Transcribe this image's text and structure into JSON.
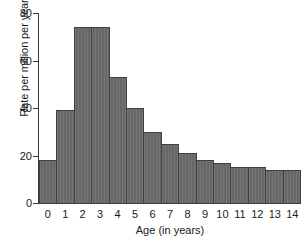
{
  "chart_data": {
    "type": "bar",
    "title": "",
    "xlabel": "Age (in years)",
    "ylabel": "Rate per million per year",
    "categories": [
      "0",
      "1",
      "2",
      "3",
      "4",
      "5",
      "6",
      "7",
      "8",
      "9",
      "10",
      "11",
      "12",
      "13",
      "14"
    ],
    "values": [
      18,
      39,
      74,
      74,
      53,
      40,
      30,
      25,
      21,
      18,
      17,
      15,
      15,
      14,
      14
    ],
    "ylim": [
      0,
      80
    ],
    "y_ticks": [
      0,
      20,
      40,
      60,
      80
    ],
    "y_tick_labels": [
      "0",
      "20",
      "40",
      "60",
      "80"
    ],
    "grid": false,
    "legend": null,
    "bar_color": "#6d6d6d",
    "bar_edge_color": "#3f3f3f",
    "axis_color": "#3a3a3a",
    "text_color": "#1a1a1a",
    "background_color": "#ffffff"
  }
}
